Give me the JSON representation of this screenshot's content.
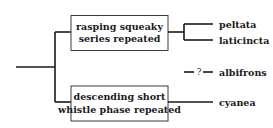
{
  "diagram": {
    "type": "tree",
    "nodes": {
      "top_box": {
        "lines": [
          "rasping squeaky",
          "series repeated"
        ]
      },
      "bottom_box": {
        "lines": [
          "descending short",
          "whistle phase repeated"
        ]
      }
    },
    "leaves": {
      "peltata": "peltata",
      "laticincta": "laticincta",
      "albifrons": "albifrons",
      "cyanea": "cyanea"
    },
    "uncertain_marker": "?"
  }
}
